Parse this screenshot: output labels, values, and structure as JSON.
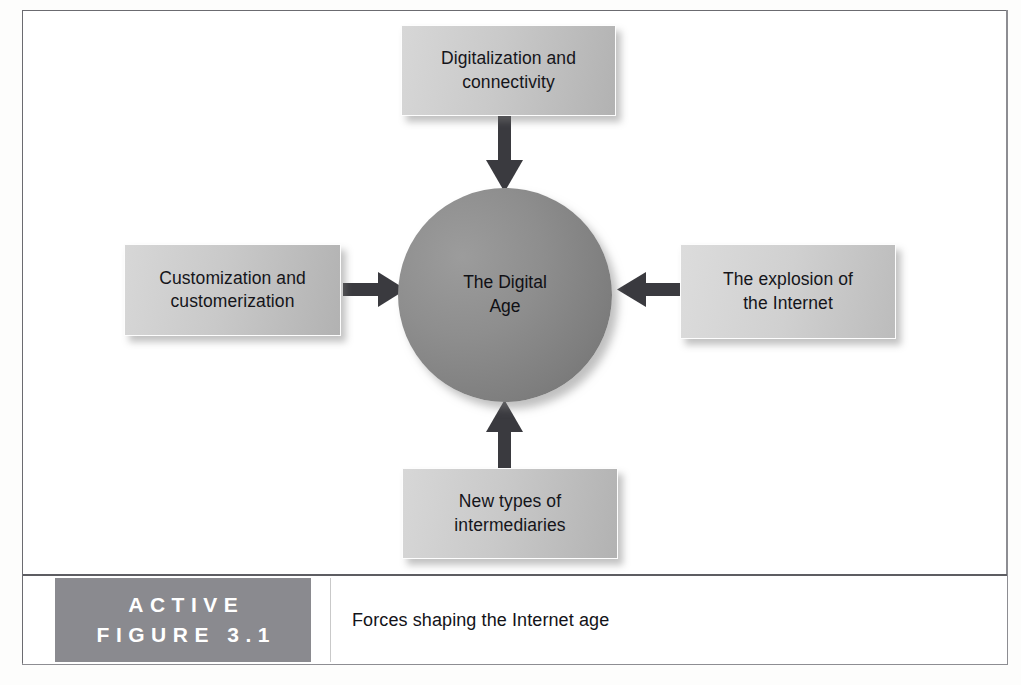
{
  "figure": {
    "label_line1": "ACTIVE",
    "label_line2": "FIGURE 3.1",
    "caption": "Forces shaping the Internet age"
  },
  "diagram": {
    "type": "hub-and-spoke",
    "hub": {
      "name": "the-digital-age",
      "line1": "The Digital",
      "line2": "Age"
    },
    "nodes": [
      {
        "name": "digitalization-and-connectivity",
        "position": "top",
        "line1": "Digitalization and",
        "line2": "connectivity",
        "arrow_direction": "down"
      },
      {
        "name": "customization-and-customerization",
        "position": "left",
        "line1": "Customization and",
        "line2": "customerization",
        "arrow_direction": "right"
      },
      {
        "name": "the-explosion-of-the-internet",
        "position": "right",
        "line1": "The explosion of",
        "line2": "the Internet",
        "arrow_direction": "left"
      },
      {
        "name": "new-types-of-intermediaries",
        "position": "bottom",
        "line1": "New types of",
        "line2": "intermediaries",
        "arrow_direction": "up"
      }
    ]
  },
  "colors": {
    "box_fill_light": "#d7d7d7",
    "box_fill_dark": "#b2b2b2",
    "hub_fill_light": "#9c9c9c",
    "hub_fill_dark": "#6f6f6f",
    "arrow": "#3a3a3f",
    "label_block": "#8a8a8f",
    "frame_border": "#6b6b70"
  }
}
